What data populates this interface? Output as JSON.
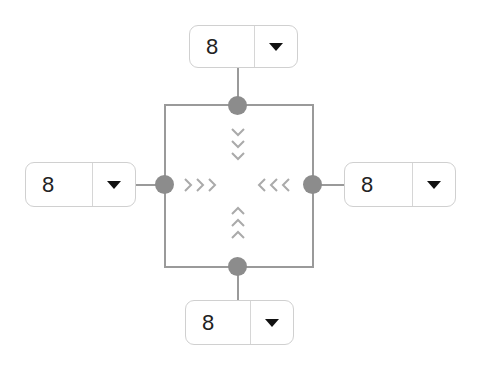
{
  "diagram": {
    "title": "",
    "line_color": "#9a9a9a",
    "node_color": "#8c8c8c",
    "chevron_color": "#aaaaaa",
    "dropdowns": {
      "top": {
        "value": "8",
        "icon": "caret-down-icon"
      },
      "left": {
        "value": "8",
        "icon": "caret-down-icon"
      },
      "right": {
        "value": "8",
        "icon": "caret-down-icon"
      },
      "bottom": {
        "value": "8",
        "icon": "caret-down-icon"
      }
    },
    "chevrons": {
      "top": {
        "direction": "down",
        "count": 3
      },
      "left": {
        "direction": "right",
        "count": 3
      },
      "right": {
        "direction": "left",
        "count": 3
      },
      "bottom": {
        "direction": "up",
        "count": 3
      }
    }
  }
}
